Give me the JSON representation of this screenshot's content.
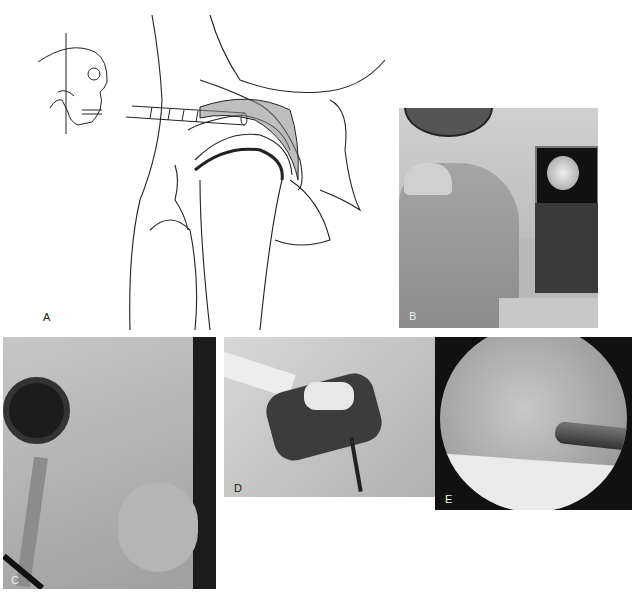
{
  "figure": {
    "panels": [
      {
        "id": "A",
        "label": "A",
        "kind": "illustration",
        "description": "Sagittal anatomical drawing of temporomandibular joint with arthroscopic cannula inserted; inset skull with vertical reference line"
      },
      {
        "id": "B",
        "label": "B",
        "kind": "photo",
        "description": "Surgeon in operating room viewing arthroscopic image on monitor"
      },
      {
        "id": "C",
        "label": "C",
        "kind": "photo",
        "description": "Arthroscope and cannulas inserted at patient's preauricular region, draped"
      },
      {
        "id": "D",
        "label": "D",
        "kind": "photo",
        "description": "Intraoperative view of open joint with instruments"
      },
      {
        "id": "E",
        "label": "E",
        "kind": "photo",
        "description": "Circular arthroscopic view of joint space with instrument tip"
      }
    ]
  },
  "colors": {
    "background": "#ffffff",
    "line_art": "#222222",
    "photo_dark": "#1a1a1a",
    "photo_mid": "#8a8a8a",
    "photo_light": "#d8d8d8"
  }
}
